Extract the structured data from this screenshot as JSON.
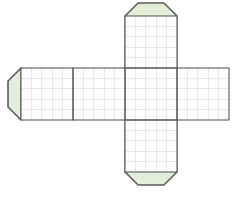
{
  "figure": {
    "title": "Cube net with glue flaps",
    "canvas": {
      "width": 234,
      "height": 200
    },
    "background_color": "#ffffff"
  },
  "style": {
    "face_fill": "#ffffff",
    "flap_fill": "#e3eed9",
    "outline_color": "#5a5a5a",
    "outline_width": 1.1,
    "grid_color": "#d8d8d8",
    "grid_width": 0.6,
    "divider_color": "#6a6a6a"
  },
  "geometry": {
    "cell_size": 52,
    "grid_divisions": 5,
    "flap_depth": 24,
    "chamfer": 13,
    "origin_x": 21,
    "origin_y": 16
  },
  "faces": [
    {
      "name": "face-left-end",
      "label": "Left end face",
      "col": 0,
      "row": 1,
      "x": 21,
      "y": 68
    },
    {
      "name": "face-left-mid",
      "label": "Left middle face",
      "col": 1,
      "row": 1,
      "x": 73,
      "y": 68
    },
    {
      "name": "face-center",
      "label": "Center face",
      "col": 2,
      "row": 1,
      "x": 125,
      "y": 68
    },
    {
      "name": "face-right-end",
      "label": "Right end face",
      "col": 3,
      "row": 1,
      "x": 177,
      "y": 68
    },
    {
      "name": "face-top",
      "label": "Top face",
      "col": 2,
      "row": 0,
      "x": 125,
      "y": 16
    },
    {
      "name": "face-bottom",
      "label": "Bottom face",
      "col": 2,
      "row": 2,
      "x": 125,
      "y": 120
    }
  ],
  "flaps": [
    {
      "name": "flap-top",
      "label": "Top glue flap",
      "edge": "top",
      "attached_to": "face-top"
    },
    {
      "name": "flap-bottom",
      "label": "Bottom glue flap",
      "edge": "bottom",
      "attached_to": "face-bottom"
    },
    {
      "name": "flap-left",
      "label": "Left glue flap",
      "edge": "left",
      "attached_to": "face-left-end"
    }
  ]
}
